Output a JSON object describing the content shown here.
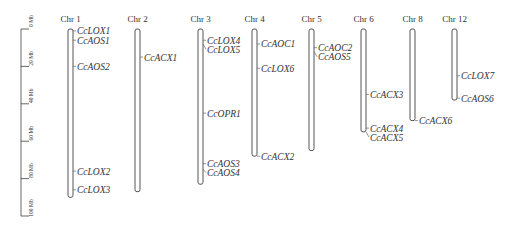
{
  "chart_data": {
    "type": "chromosome_map",
    "title": "",
    "unit": "Mb",
    "scale": {
      "ticks": [
        0,
        20,
        40,
        60,
        80,
        100
      ],
      "tick_labels": [
        "0 Mb",
        "20 Mb",
        "40 Mb",
        "60 Mb",
        "80 Mb",
        "100 Mb"
      ],
      "range": [
        0,
        100
      ]
    },
    "chromosomes": [
      {
        "name": "Chr 1",
        "length": 90,
        "genes": [
          {
            "name": "CcLOX1",
            "position": 1
          },
          {
            "name": "CcAOS1",
            "position": 6
          },
          {
            "name": "CcAOS2",
            "position": 20
          },
          {
            "name": "CcLOX2",
            "position": 76
          },
          {
            "name": "CcLOX3",
            "position": 86
          }
        ]
      },
      {
        "name": "Chr 2",
        "length": 87,
        "genes": [
          {
            "name": "CcACX1",
            "position": 15
          }
        ]
      },
      {
        "name": "Chr 3",
        "length": 83,
        "genes": [
          {
            "name": "CcLOX4",
            "position": 6
          },
          {
            "name": "CcLOX5",
            "position": 8
          },
          {
            "name": "CcOPR1",
            "position": 45
          },
          {
            "name": "CcAOS3",
            "position": 72
          },
          {
            "name": "CcAOS4",
            "position": 75
          }
        ]
      },
      {
        "name": "Chr 4",
        "length": 68,
        "genes": [
          {
            "name": "CcAOC1",
            "position": 8
          },
          {
            "name": "CcLOX6",
            "position": 21
          },
          {
            "name": "CcACX2",
            "position": 68
          }
        ]
      },
      {
        "name": "Chr 5",
        "length": 65,
        "genes": [
          {
            "name": "CcAOC2",
            "position": 10
          },
          {
            "name": "CcAOS5",
            "position": 12
          }
        ]
      },
      {
        "name": "Chr 6",
        "length": 55,
        "genes": [
          {
            "name": "CcACX3",
            "position": 35
          },
          {
            "name": "CcACX4",
            "position": 53
          },
          {
            "name": "CcACX5",
            "position": 55
          }
        ]
      },
      {
        "name": "Chr 8",
        "length": 49,
        "genes": [
          {
            "name": "CcACX6",
            "position": 49
          }
        ]
      },
      {
        "name": "Chr 12",
        "length": 38,
        "genes": [
          {
            "name": "CcLOX7",
            "position": 25
          },
          {
            "name": "CcAOS6",
            "position": 37
          }
        ]
      }
    ]
  }
}
